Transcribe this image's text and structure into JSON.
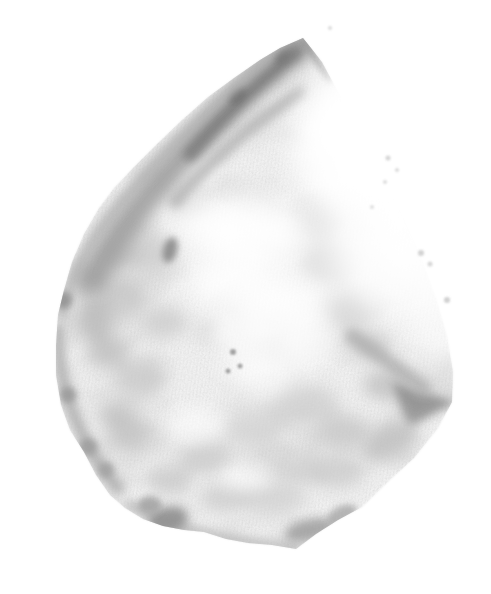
{
  "image": {
    "description": "Grayscale stipple illustration of an irregular teardrop-shaped flint stone with a dark pointed ridge rising to the upper right, mottled light-gray surface, resting on a plain white background",
    "background_color": "#ffffff",
    "palette": {
      "paper": "#ffffff",
      "stone_base": "#f1f1f1",
      "shading_light": "#cbcbcb",
      "shading_mid": "#aeaeae",
      "shading_dark": "#8f8f8f",
      "ridge_darkest": "#6e6e6e"
    }
  }
}
